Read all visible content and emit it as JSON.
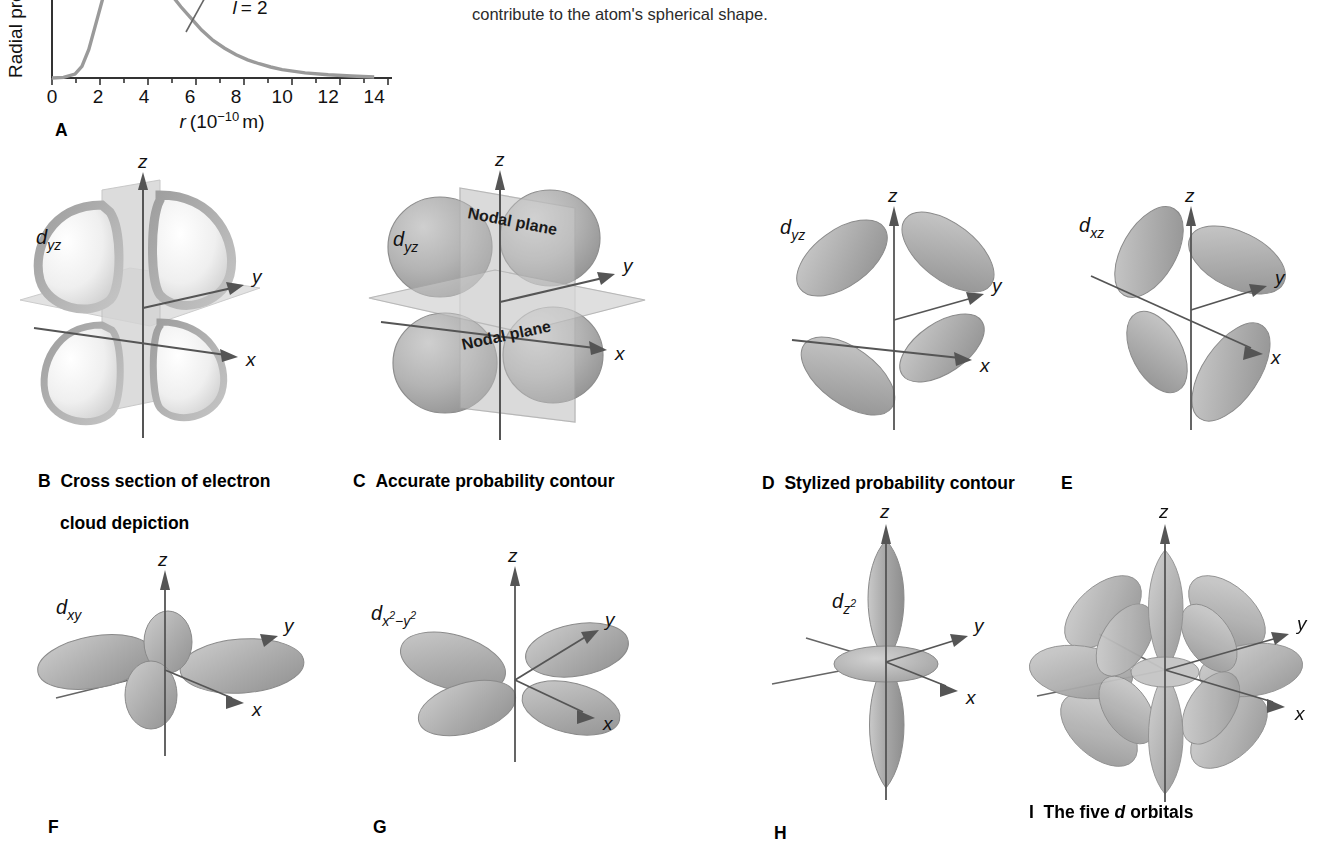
{
  "figure": {
    "caption_line1": "a central, donut-shaped region. I, A composite of the five 3d (stylized) orbitals shows how the",
    "caption_line2": "contribute to the atom's spherical shape.",
    "caption_lead_fragment": "and a central, donut-shaped region.",
    "caption_bold_marker": "I,",
    "caption_rest": "A composite of the five 3d (stylized) orbitals shows how the contribute to the atom's spherical shape."
  },
  "colors": {
    "lobe_fill": "#b9b9b9",
    "lobe_fill_light": "#d8d8d8",
    "lobe_fill_dark": "#9a9a9a",
    "lobe_stroke": "#8a8a8a",
    "plane_fill": "#cfcfcf",
    "axis_stroke": "#555555",
    "curve_stroke": "#9a9a9a",
    "text": "#111111",
    "background": "#ffffff"
  },
  "chart_data": {
    "type": "line",
    "title": "",
    "xlabel": "r (10⁻¹⁰ m)",
    "ylabel": "Radial probability",
    "xlabel_italic_part": "r",
    "xlabel_rest": "(10",
    "xlabel_exponent": "−10",
    "xlabel_unit": "m)",
    "xticks": [
      "0",
      "2",
      "4",
      "6",
      "8",
      "10",
      "12",
      "14"
    ],
    "xlim": [
      0,
      14.6
    ],
    "ylim": [
      0,
      1.05
    ],
    "grid": false,
    "legend_position": "inside-top",
    "annotations": [
      {
        "text": "l = 2",
        "italic_symbol": "l",
        "value": "2"
      }
    ],
    "series": [
      {
        "name": "3d radial probability",
        "x": [
          0,
          0.5,
          1.0,
          1.3,
          1.6,
          2.0,
          2.4,
          2.8,
          3.2,
          3.6,
          4.0,
          4.4,
          4.8,
          5.2,
          5.6,
          6.0,
          6.5,
          7.0,
          7.5,
          8.0,
          8.5,
          9.0,
          9.5,
          10.0,
          11.0,
          12.0,
          13.0,
          14.0
        ],
        "y": [
          0.0,
          0.005,
          0.03,
          0.09,
          0.22,
          0.48,
          0.74,
          0.92,
          1.0,
          0.99,
          0.93,
          0.84,
          0.74,
          0.64,
          0.55,
          0.47,
          0.37,
          0.29,
          0.23,
          0.18,
          0.14,
          0.11,
          0.085,
          0.065,
          0.04,
          0.025,
          0.015,
          0.008
        ]
      }
    ]
  },
  "panels": [
    {
      "id": "A",
      "letter": "A",
      "caption": "",
      "orbital_label": "",
      "type": "chart"
    },
    {
      "id": "B",
      "letter": "B",
      "caption": "Cross section of electron\ncloud depiction",
      "caption_line1": "Cross section of electron",
      "caption_line2": "cloud depiction",
      "orbital_label": "d",
      "orbital_sub": "yz",
      "orbital_sup": "",
      "axes": [
        "z",
        "y",
        "x"
      ],
      "type": "orbital",
      "style": "cross-section",
      "nodal_labels": []
    },
    {
      "id": "C",
      "letter": "C",
      "caption": "Accurate probability contour",
      "orbital_label": "d",
      "orbital_sub": "yz",
      "orbital_sup": "",
      "axes": [
        "z",
        "y",
        "x"
      ],
      "type": "orbital",
      "style": "accurate",
      "nodal_labels": [
        "Nodal plane",
        "Nodal plane"
      ]
    },
    {
      "id": "D",
      "letter": "D",
      "caption": "Stylized probability contour",
      "orbital_label": "d",
      "orbital_sub": "yz",
      "orbital_sup": "",
      "axes": [
        "z",
        "y",
        "x"
      ],
      "type": "orbital",
      "style": "stylized",
      "nodal_labels": []
    },
    {
      "id": "E",
      "letter": "E",
      "caption": "",
      "orbital_label": "d",
      "orbital_sub": "xz",
      "orbital_sup": "",
      "axes": [
        "z",
        "y",
        "x"
      ],
      "type": "orbital",
      "style": "stylized",
      "nodal_labels": []
    },
    {
      "id": "F",
      "letter": "F",
      "caption": "",
      "orbital_label": "d",
      "orbital_sub": "xy",
      "orbital_sup": "",
      "axes": [
        "z",
        "y",
        "x"
      ],
      "type": "orbital",
      "style": "stylized-xy",
      "nodal_labels": []
    },
    {
      "id": "G",
      "letter": "G",
      "caption": "",
      "orbital_label": "d",
      "orbital_sub": "x",
      "orbital_sup": "2",
      "orbital_sub2": "−y",
      "orbital_sup2": "2",
      "axes": [
        "z",
        "y",
        "x"
      ],
      "type": "orbital",
      "style": "stylized-x2y2",
      "nodal_labels": []
    },
    {
      "id": "H",
      "letter": "H",
      "caption": "",
      "orbital_label": "d",
      "orbital_sub": "z",
      "orbital_sup": "2",
      "axes": [
        "z",
        "y",
        "x"
      ],
      "type": "orbital",
      "style": "dz2",
      "nodal_labels": []
    },
    {
      "id": "I",
      "letter": "I",
      "caption": "The five d orbitals",
      "caption_pre": "The five ",
      "caption_italic": "d",
      "caption_post": " orbitals",
      "orbital_label": "",
      "axes": [
        "z",
        "y",
        "x"
      ],
      "type": "orbital",
      "style": "composite",
      "nodal_labels": []
    }
  ],
  "axis_letters": {
    "z": "z",
    "y": "y",
    "x": "x"
  }
}
